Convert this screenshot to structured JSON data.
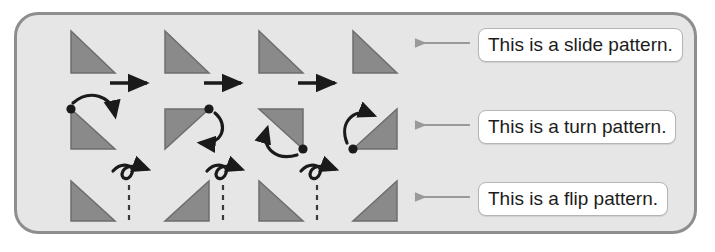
{
  "diagram": {
    "colors": {
      "panel_fill": "#e6e6e6",
      "panel_border": "#8e8e8e",
      "triangle_fill": "#8a8a8a",
      "triangle_stroke": "#6e6e6e",
      "arrow": "#1a1a1a",
      "pointer_arrow": "#9a9a9a",
      "label_text": "#1c1c1c",
      "label_bg": "#ffffff",
      "label_border": "#b4b4b4",
      "dashed_line": "#3a3a3a"
    },
    "rows": [
      {
        "id": "slide",
        "label": "This is a slide pattern.",
        "transformation": "slide",
        "shape_count": 4,
        "connector_count": 3,
        "connector_type": "straight-right-arrow",
        "orientations": [
          "right-angle-bottom-left",
          "right-angle-bottom-left",
          "right-angle-bottom-left",
          "right-angle-bottom-left"
        ]
      },
      {
        "id": "turn",
        "label": "This is a turn pattern.",
        "transformation": "turn",
        "shape_count": 4,
        "connector_count": 0,
        "connector_type": "curved-rotation-arrow",
        "orientations": [
          "right-angle-bottom-left",
          "right-angle-top-left",
          "right-angle-top-right",
          "right-angle-bottom-right"
        ],
        "pivots": [
          "top-left",
          "top-right",
          "bottom-right",
          "bottom-left"
        ],
        "rotation_degrees": 90,
        "rotation_direction": "clockwise"
      },
      {
        "id": "flip",
        "label": "This is a flip pattern.",
        "transformation": "flip",
        "shape_count": 4,
        "connector_count": 3,
        "connector_type": "loop-flip-arrow-over-dashed-mirror-line",
        "orientations": [
          "right-angle-bottom-left",
          "right-angle-bottom-right",
          "right-angle-bottom-left",
          "right-angle-bottom-right"
        ]
      }
    ]
  }
}
